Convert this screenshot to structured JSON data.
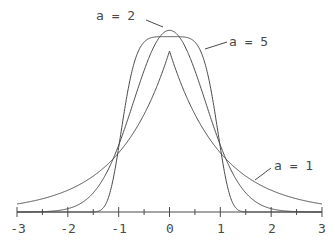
{
  "chart_data": {
    "type": "line",
    "title": "",
    "xlabel": "",
    "ylabel": "",
    "xlim": [
      -3,
      3
    ],
    "ylim": [
      0,
      0.6
    ],
    "grid": false,
    "legend": "inline labels with leader lines",
    "x_ticks": [
      -3,
      -2,
      -1,
      0,
      1,
      2,
      3
    ],
    "x_minor_ticks": [
      -2.5,
      -1.5,
      -0.5,
      0.5,
      1.5,
      2.5
    ],
    "x_tick_labels": [
      "-3",
      "-2",
      "-1",
      "0",
      "1",
      "2",
      "3"
    ],
    "function": "f(x) = a / (2 Γ(1/a)) · exp(-|x|^a)",
    "series": [
      {
        "name": "a = 1",
        "a": 1,
        "peak": 0.5,
        "x": [
          -3,
          -2,
          -1,
          -0.5,
          0,
          0.5,
          1,
          2,
          3
        ],
        "values": [
          0.025,
          0.068,
          0.184,
          0.303,
          0.5,
          0.303,
          0.184,
          0.068,
          0.025
        ]
      },
      {
        "name": "a = 2",
        "a": 2,
        "peak": 0.564,
        "x": [
          -3,
          -2,
          -1,
          -0.5,
          0,
          0.5,
          1,
          2,
          3
        ],
        "values": [
          0.0001,
          0.01,
          0.208,
          0.439,
          0.564,
          0.439,
          0.208,
          0.01,
          0.0001
        ]
      },
      {
        "name": "a = 5",
        "a": 5,
        "peak": 0.545,
        "x": [
          -3,
          -2,
          -1,
          -0.5,
          0,
          0.5,
          1,
          2,
          3
        ],
        "values": [
          0.0,
          0.0,
          0.2,
          0.528,
          0.545,
          0.528,
          0.2,
          0.0,
          0.0
        ]
      }
    ],
    "annotations": [
      "a = 2",
      "a = 5",
      "a = 1"
    ]
  },
  "labels": {
    "a2": "a = 2",
    "a5": "a = 5",
    "a1": "a = 1"
  },
  "axis": {
    "tick_labels": [
      "-3",
      "-2",
      "-1",
      "0",
      "1",
      "2",
      "3"
    ]
  },
  "colors": {
    "ink": "#4a4a4a",
    "background": "#ffffff"
  }
}
